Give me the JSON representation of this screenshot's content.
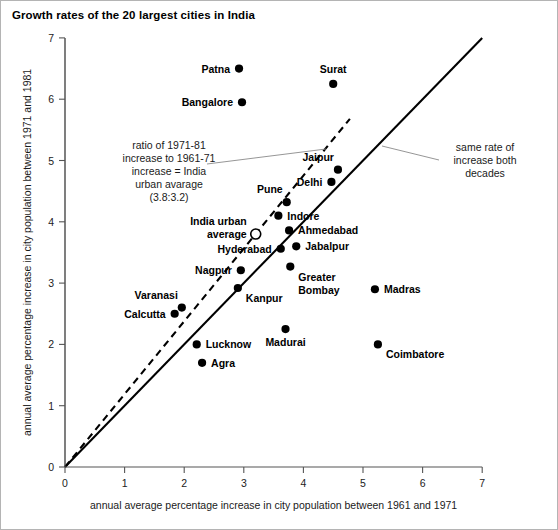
{
  "chart_data": {
    "type": "scatter",
    "title": "Growth rates of the 20 largest cities in India",
    "xlabel": "annual average percentage increase in city population between 1961 and 1971",
    "ylabel": "annual average percentage increase in city population between 1971 and 1981",
    "xlim": [
      0,
      7
    ],
    "ylim": [
      0,
      7
    ],
    "xticks": [
      "0",
      "1",
      "2",
      "3",
      "4",
      "5",
      "6",
      "7"
    ],
    "yticks": [
      "0",
      "1",
      "2",
      "3",
      "4",
      "5",
      "6",
      "7"
    ],
    "grid": false,
    "legend": "none",
    "marker_color": "#000000",
    "points": [
      {
        "label": "Patna",
        "x": 2.92,
        "y": 6.5,
        "label_pos": "left",
        "marker": "filled"
      },
      {
        "label": "Surat",
        "x": 4.5,
        "y": 6.25,
        "label_pos": "above",
        "marker": "filled"
      },
      {
        "label": "Bangalore",
        "x": 2.97,
        "y": 5.95,
        "label_pos": "left",
        "marker": "filled"
      },
      {
        "label": "Jaipur",
        "x": 4.58,
        "y": 4.85,
        "label_pos": "above-left",
        "marker": "filled"
      },
      {
        "label": "Delhi",
        "x": 4.47,
        "y": 4.65,
        "label_pos": "left",
        "marker": "filled"
      },
      {
        "label": "Pune",
        "x": 3.72,
        "y": 4.32,
        "label_pos": "above-left",
        "marker": "filled"
      },
      {
        "label": "Indore",
        "x": 3.58,
        "y": 4.1,
        "label_pos": "right",
        "marker": "filled"
      },
      {
        "label": "India urban average",
        "x": 3.2,
        "y": 3.8,
        "label_pos": "left",
        "marker": "open"
      },
      {
        "label": "Ahmedabad",
        "x": 3.76,
        "y": 3.86,
        "label_pos": "right",
        "marker": "filled"
      },
      {
        "label": "Jabalpur",
        "x": 3.88,
        "y": 3.6,
        "label_pos": "right",
        "marker": "filled"
      },
      {
        "label": "Hyderabad",
        "x": 3.62,
        "y": 3.56,
        "label_pos": "left",
        "marker": "filled"
      },
      {
        "label": "Greater Bombay",
        "x": 3.78,
        "y": 3.27,
        "label_pos": "below-right",
        "marker": "filled"
      },
      {
        "label": "Nagpur",
        "x": 2.95,
        "y": 3.21,
        "label_pos": "left",
        "marker": "filled"
      },
      {
        "label": "Kanpur",
        "x": 2.9,
        "y": 2.92,
        "label_pos": "below-right",
        "marker": "filled"
      },
      {
        "label": "Madras",
        "x": 5.2,
        "y": 2.9,
        "label_pos": "right",
        "marker": "filled"
      },
      {
        "label": "Varanasi",
        "x": 1.96,
        "y": 2.6,
        "label_pos": "above-left",
        "marker": "filled"
      },
      {
        "label": "Calcutta",
        "x": 1.84,
        "y": 2.5,
        "label_pos": "left",
        "marker": "filled"
      },
      {
        "label": "Madurai",
        "x": 3.7,
        "y": 2.25,
        "label_pos": "below",
        "marker": "filled"
      },
      {
        "label": "Lucknow",
        "x": 2.21,
        "y": 2.0,
        "label_pos": "right",
        "marker": "filled"
      },
      {
        "label": "Coimbatore",
        "x": 5.25,
        "y": 2.0,
        "label_pos": "below-right",
        "marker": "filled"
      },
      {
        "label": "Agra",
        "x": 2.3,
        "y": 1.7,
        "label_pos": "right",
        "marker": "filled"
      }
    ],
    "reference_lines": [
      {
        "name": "india-urban-average-ratio",
        "style": "dashed",
        "slope": 1.1875,
        "from": [
          0,
          0
        ],
        "to": [
          4.78,
          5.68
        ]
      },
      {
        "name": "same-rate-both-decades",
        "style": "solid",
        "slope": 1.0,
        "from": [
          0,
          0
        ],
        "to": [
          7.0,
          7.0
        ]
      }
    ],
    "annotations": [
      {
        "name": "ratio-note",
        "lines": [
          "ratio of  1971-81",
          "increase to 1961-71",
          "increase = India",
          "urban avarage",
          "(3.8:3.2)"
        ]
      },
      {
        "name": "same-rate-note",
        "lines": [
          "same rate of",
          "increase both",
          "decades"
        ]
      }
    ]
  }
}
